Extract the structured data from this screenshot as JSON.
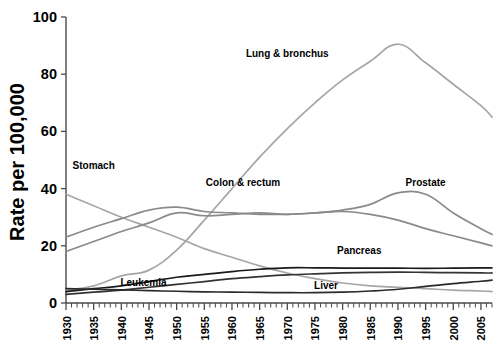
{
  "chart_data": {
    "type": "line",
    "title": "",
    "xlabel": "",
    "ylabel": "Rate per 100,000",
    "xlim": [
      1930,
      2007
    ],
    "ylim": [
      0,
      100
    ],
    "yticks": [
      0,
      20,
      40,
      60,
      80,
      100
    ],
    "xticks": [
      1930,
      1935,
      1940,
      1945,
      1950,
      1955,
      1960,
      1965,
      1970,
      1975,
      1980,
      1985,
      1990,
      1995,
      2000,
      2005
    ],
    "xtick_minor_step": 1,
    "grid": false,
    "legend_position": "inline-annotations",
    "x": [
      1930,
      1935,
      1940,
      1945,
      1950,
      1955,
      1960,
      1965,
      1970,
      1975,
      1980,
      1985,
      1990,
      1995,
      2000,
      2005,
      2007
    ],
    "series": [
      {
        "name": "Lung & bronchus",
        "color": "#a6a6a6",
        "label_x": 1970,
        "label_y": 86,
        "values": [
          4.5,
          6.0,
          9.5,
          11.5,
          18.5,
          29.0,
          40.0,
          51.0,
          61.0,
          70.0,
          78.0,
          84.5,
          90.5,
          84.0,
          76.5,
          69.0,
          65.0
        ]
      },
      {
        "name": "Stomach",
        "color": "#a6a6a6",
        "label_x": 1935,
        "label_y": 47,
        "values": [
          38.0,
          34.0,
          30.0,
          26.5,
          23.0,
          19.0,
          16.0,
          13.0,
          10.5,
          8.5,
          7.0,
          6.0,
          5.5,
          5.0,
          4.5,
          4.2,
          4.0
        ]
      },
      {
        "name": "Colon & rectum",
        "color": "#8a8a8a",
        "label_x": 1962,
        "label_y": 41,
        "values": [
          23.0,
          26.5,
          29.5,
          32.5,
          33.5,
          32.0,
          31.5,
          31.0,
          31.0,
          31.5,
          32.0,
          31.0,
          29.0,
          26.0,
          23.5,
          21.0,
          20.0
        ]
      },
      {
        "name": "Prostate",
        "color": "#8a8a8a",
        "label_x": 1995,
        "label_y": 41,
        "values": [
          18.0,
          21.5,
          25.0,
          28.0,
          31.5,
          30.5,
          31.0,
          31.5,
          31.0,
          31.5,
          32.5,
          34.5,
          38.5,
          38.0,
          31.5,
          26.0,
          24.0
        ]
      },
      {
        "name": "Pancreas",
        "color": "#1a1a1a",
        "label_x": 1983,
        "label_y": 17,
        "values": [
          4.0,
          5.0,
          6.0,
          7.5,
          9.0,
          10.0,
          11.0,
          11.8,
          12.3,
          12.3,
          12.2,
          12.2,
          12.2,
          12.1,
          12.2,
          12.3,
          12.3
        ]
      },
      {
        "name": "Leukemia",
        "color": "#333333",
        "label_x": 1944,
        "label_y": 6,
        "values": [
          3.0,
          3.8,
          4.5,
          5.5,
          6.5,
          7.5,
          8.5,
          9.2,
          9.8,
          10.2,
          10.5,
          10.7,
          10.8,
          10.7,
          10.6,
          10.5,
          10.5
        ]
      },
      {
        "name": "Liver",
        "color": "#2b2b2b",
        "label_x": 1977,
        "label_y": 5,
        "values": [
          5.0,
          4.8,
          4.6,
          4.3,
          4.1,
          3.9,
          3.8,
          3.7,
          3.6,
          3.6,
          3.8,
          4.2,
          4.8,
          5.8,
          6.8,
          7.6,
          8.0
        ]
      }
    ]
  },
  "figure": {
    "caption": ""
  }
}
